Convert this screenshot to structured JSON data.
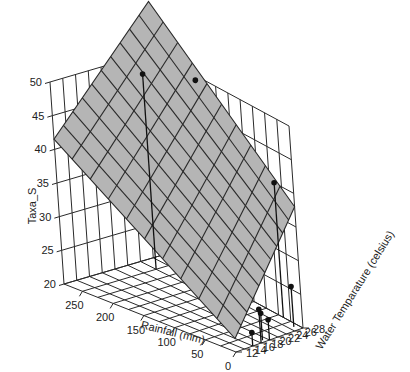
{
  "chart_data": {
    "type": "scatter3d_with_surface",
    "title": "",
    "xlabel": "Rainfall (mm)",
    "ylabel": "Water Temparature (celsius)",
    "zlabel": "Taxa_S",
    "x_ticks": [
      "250",
      "200",
      "150",
      "100",
      "50",
      "0"
    ],
    "y_ticks": [
      "12",
      "14",
      "16",
      "18",
      "20",
      "22",
      "24",
      "26",
      "28"
    ],
    "z_ticks": [
      "20",
      "25",
      "30",
      "35",
      "40",
      "45",
      "50"
    ],
    "xlim": [
      0,
      280
    ],
    "ylim": [
      12,
      28
    ],
    "zlim": [
      20,
      50
    ],
    "grid": true,
    "surface": {
      "description": "Fitted regression plane, grey mesh 10x10",
      "color": "#b5b5b5",
      "grid_divisions": 10
    },
    "points": [
      {
        "rainfall": 250,
        "temperature": 24,
        "taxa_s": 49
      },
      {
        "rainfall": 180,
        "temperature": 27,
        "taxa_s": 50
      },
      {
        "rainfall": 40,
        "temperature": 28,
        "taxa_s": 40
      },
      {
        "rainfall": 10,
        "temperature": 27,
        "taxa_s": 26
      },
      {
        "rainfall": 0,
        "temperature": 18,
        "taxa_s": 25
      },
      {
        "rainfall": 5,
        "temperature": 19,
        "taxa_s": 24
      },
      {
        "rainfall": 0,
        "temperature": 20,
        "taxa_s": 23
      },
      {
        "rainfall": 0,
        "temperature": 16,
        "taxa_s": 22
      }
    ]
  },
  "labels": {
    "z_axis": "Taxa_S",
    "x_axis": "Rainfall (mm)",
    "y_axis": "Water Temparature (celsius)"
  }
}
